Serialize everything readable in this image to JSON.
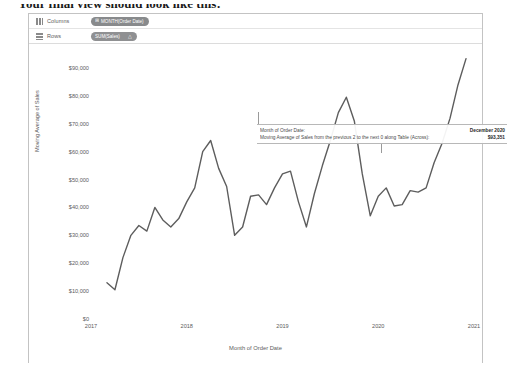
{
  "document": {
    "heading_partial": "Your final view should look like this:"
  },
  "shelves": {
    "columns": {
      "label": "Columns",
      "icon": "columns-icon",
      "pill": {
        "text": "MONTH(Order Date)",
        "prefix_icon": "calendar-plus-icon"
      }
    },
    "rows": {
      "label": "Rows",
      "icon": "rows-icon",
      "pill": {
        "text": "SUM(Sales)",
        "suffix_icon": "delta-table-calc-icon"
      }
    }
  },
  "annotation": {
    "rows": [
      {
        "label": "Month of Order Date:",
        "value": "December 2020"
      },
      {
        "label": "Moving Average of Sales from the previous 2 to the next 0 along Table (Across):",
        "value": "$93,351"
      }
    ]
  },
  "chart_data": {
    "type": "line",
    "title": "",
    "xlabel": "Month of Order Date",
    "ylabel": "Moving Average of Sales",
    "ylim": [
      0,
      95000
    ],
    "yticks": [
      0,
      10000,
      20000,
      30000,
      40000,
      50000,
      60000,
      70000,
      80000,
      90000
    ],
    "ytick_labels": [
      "$0",
      "$10,000",
      "$20,000",
      "$30,000",
      "$40,000",
      "$50,000",
      "$60,000",
      "$70,000",
      "$80,000",
      "$90,000"
    ],
    "xticks": [
      "2017",
      "2018",
      "2019",
      "2020",
      "2021"
    ],
    "grid": false,
    "legend": "none",
    "line_color": "#5d5d5d",
    "series": [
      {
        "name": "Moving Average of Sales",
        "x": [
          "2017-03",
          "2017-04",
          "2017-05",
          "2017-06",
          "2017-07",
          "2017-08",
          "2017-09",
          "2017-10",
          "2017-11",
          "2017-12",
          "2018-01",
          "2018-02",
          "2018-03",
          "2018-04",
          "2018-05",
          "2018-06",
          "2018-07",
          "2018-08",
          "2018-09",
          "2018-10",
          "2018-11",
          "2018-12",
          "2019-01",
          "2019-02",
          "2019-03",
          "2019-04",
          "2019-05",
          "2019-06",
          "2019-07",
          "2019-08",
          "2019-09",
          "2019-10",
          "2019-11",
          "2019-12",
          "2020-01",
          "2020-02",
          "2020-03",
          "2020-04",
          "2020-05",
          "2020-06",
          "2020-07",
          "2020-08",
          "2020-09",
          "2020-10",
          "2020-11",
          "2020-12"
        ],
        "values": [
          13000,
          10500,
          22000,
          30000,
          33500,
          31500,
          40000,
          35500,
          33000,
          36000,
          42000,
          47000,
          60000,
          64000,
          54000,
          47500,
          30000,
          33000,
          44000,
          44500,
          41000,
          47000,
          52000,
          53000,
          42000,
          33000,
          45000,
          55000,
          64000,
          74000,
          79500,
          71000,
          52000,
          37000,
          44000,
          47000,
          40500,
          41000,
          46000,
          45500,
          47000,
          56000,
          63000,
          72000,
          84000,
          93351
        ]
      }
    ],
    "last_point_label": {
      "period": "December 2020",
      "value": "$93,351"
    }
  }
}
